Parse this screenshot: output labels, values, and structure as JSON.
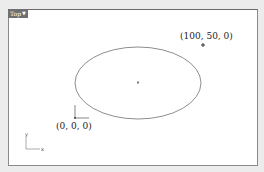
{
  "viewport": {
    "name": "Top",
    "menu_icon": "triangle-down-icon"
  },
  "points": [
    {
      "label": "(100, 50, 0)",
      "kind": "point-marker"
    },
    {
      "label": "(0, 0, 0)",
      "kind": "origin-cplane-marker"
    }
  ],
  "axes_gizmo": {
    "x_label": "x",
    "y_label": "y"
  },
  "ellipse": {
    "center_marker": "center-point"
  },
  "colors": {
    "tab_bg": "#6f6f6f",
    "curve": "#707070",
    "border": "#8a8a8a"
  }
}
